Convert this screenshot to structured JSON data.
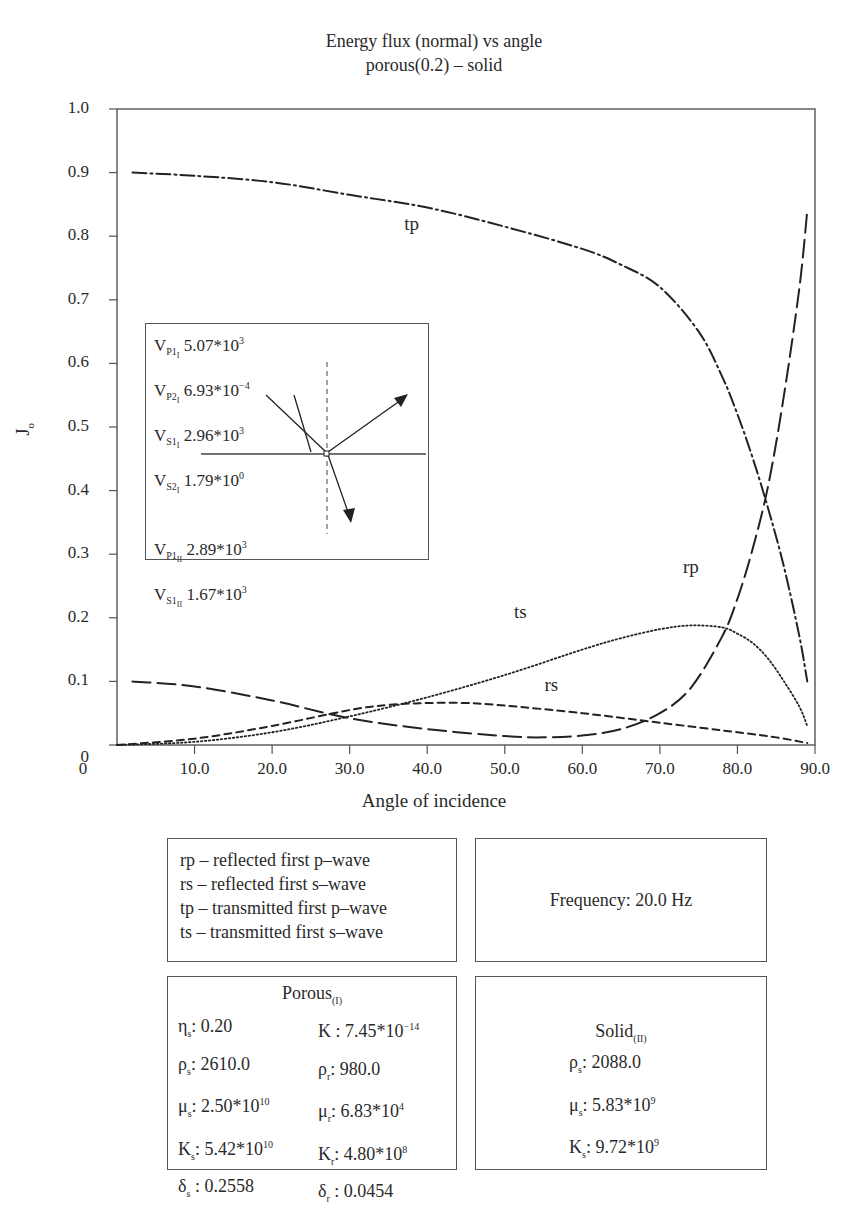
{
  "chart_data": {
    "type": "line",
    "title": "Energy flux (normal) vs angle",
    "subtitle": "porous(0.2) – solid",
    "xlabel": "Angle of incidence",
    "ylabel": "J₀",
    "xlim": [
      0,
      90
    ],
    "ylim": [
      0,
      1.0
    ],
    "x_ticks": [
      "0",
      "10.0",
      "20.0",
      "30.0",
      "40.0",
      "50.0",
      "60.0",
      "70.0",
      "80.0",
      "90.0"
    ],
    "y_ticks": [
      "0",
      "0.1",
      "0.2",
      "0.3",
      "0.4",
      "0.5",
      "0.6",
      "0.7",
      "0.8",
      "0.9",
      "1.0"
    ],
    "grid": false,
    "series": [
      {
        "name": "tp",
        "label": "transmitted first p–wave",
        "style": "dash-dot",
        "x": [
          2,
          10,
          20,
          30,
          40,
          50,
          60,
          65,
          70,
          75,
          78,
          80,
          82,
          84,
          86,
          88,
          89
        ],
        "y": [
          0.9,
          0.895,
          0.885,
          0.865,
          0.845,
          0.815,
          0.78,
          0.755,
          0.72,
          0.65,
          0.58,
          0.52,
          0.45,
          0.37,
          0.28,
          0.17,
          0.1
        ]
      },
      {
        "name": "rp",
        "label": "reflected first p–wave",
        "style": "long-dash",
        "x": [
          2,
          10,
          20,
          30,
          40,
          50,
          55,
          60,
          65,
          70,
          74,
          78,
          80,
          82,
          84,
          86,
          88,
          89
        ],
        "y": [
          0.1,
          0.092,
          0.07,
          0.042,
          0.025,
          0.014,
          0.012,
          0.015,
          0.025,
          0.05,
          0.09,
          0.17,
          0.23,
          0.31,
          0.41,
          0.55,
          0.72,
          0.84
        ]
      },
      {
        "name": "ts",
        "label": "transmitted first s–wave",
        "style": "dotted",
        "x": [
          0,
          10,
          20,
          30,
          40,
          50,
          60,
          65,
          70,
          74,
          78,
          80,
          82,
          84,
          86,
          88,
          89
        ],
        "y": [
          0.0,
          0.005,
          0.02,
          0.045,
          0.075,
          0.11,
          0.15,
          0.168,
          0.182,
          0.188,
          0.185,
          0.175,
          0.16,
          0.135,
          0.1,
          0.06,
          0.03
        ]
      },
      {
        "name": "rs",
        "label": "reflected first s–wave",
        "style": "short-dash",
        "x": [
          0,
          10,
          20,
          30,
          35,
          40,
          45,
          50,
          60,
          70,
          80,
          85,
          89
        ],
        "y": [
          0.0,
          0.01,
          0.03,
          0.055,
          0.063,
          0.066,
          0.066,
          0.062,
          0.05,
          0.035,
          0.02,
          0.012,
          0.003
        ]
      }
    ],
    "annotations": [
      {
        "text": "tp",
        "x": 38,
        "y": 0.81
      },
      {
        "text": "rp",
        "x": 74,
        "y": 0.27
      },
      {
        "text": "ts",
        "x": 52,
        "y": 0.2
      },
      {
        "text": "rs",
        "x": 56,
        "y": 0.085
      }
    ],
    "inset": {
      "rows": [
        {
          "v": "V",
          "sub": "P1",
          "subsub": "I",
          "mant": "5.07*10",
          "exp": "3"
        },
        {
          "v": "V",
          "sub": "P2",
          "subsub": "I",
          "mant": "6.93*10",
          "exp": "−4"
        },
        {
          "v": "V",
          "sub": "S1",
          "subsub": "I",
          "mant": "2.96*10",
          "exp": "3"
        },
        {
          "v": "V",
          "sub": "S2",
          "subsub": "I",
          "mant": "1.79*10",
          "exp": "0"
        },
        {
          "v": "V",
          "sub": "P1",
          "subsub": "II",
          "mant": "2.89*10",
          "exp": "3"
        },
        {
          "v": "V",
          "sub": "S1",
          "subsub": "II",
          "mant": "1.67*10",
          "exp": "3"
        }
      ]
    }
  },
  "legend_box": {
    "lines": [
      "rp – reflected first p–wave",
      "rs – reflected first s–wave",
      "tp – transmitted first p–wave",
      "ts – transmitted first s–wave"
    ]
  },
  "frequency_box": {
    "text": "Frequency: 20.0 Hz"
  },
  "porous_box": {
    "title": "Porous",
    "title_sub": "(I)",
    "left": [
      {
        "sym": "η",
        "sub": "s",
        "val": ": 0.20",
        "exp": ""
      },
      {
        "sym": "ρ",
        "sub": "s",
        "val": ": 2610.0",
        "exp": ""
      },
      {
        "sym": "μ",
        "sub": "s",
        "val": ": 2.50*10",
        "exp": "10"
      },
      {
        "sym": "K",
        "sub": "s",
        "val": ": 5.42*10",
        "exp": "10"
      },
      {
        "sym": "δ",
        "sub": "s",
        "val": " : 0.2558",
        "exp": ""
      }
    ],
    "right": [
      {
        "sym": "K",
        "sub": "",
        "val": " : 7.45*10",
        "exp": "−14"
      },
      {
        "sym": "ρ",
        "sub": "r",
        "val": ": 980.0",
        "exp": ""
      },
      {
        "sym": "μ",
        "sub": "r",
        "val": ": 6.83*10",
        "exp": "4"
      },
      {
        "sym": "K",
        "sub": "r",
        "val": ": 4.80*10",
        "exp": "8"
      },
      {
        "sym": "δ",
        "sub": "r",
        "val": " : 0.0454",
        "exp": ""
      }
    ]
  },
  "solid_box": {
    "title": "Solid",
    "title_sub": "(II)",
    "rows": [
      {
        "sym": "ρ",
        "sub": "s",
        "val": ": 2088.0",
        "exp": ""
      },
      {
        "sym": "μ",
        "sub": "s",
        "val": ": 5.83*10",
        "exp": "9"
      },
      {
        "sym": "K",
        "sub": "s",
        "val": ": 9.72*10",
        "exp": "9"
      }
    ]
  },
  "colors": {
    "ink": "#2a2a2a",
    "frame": "#555555",
    "background": "#ffffff"
  }
}
